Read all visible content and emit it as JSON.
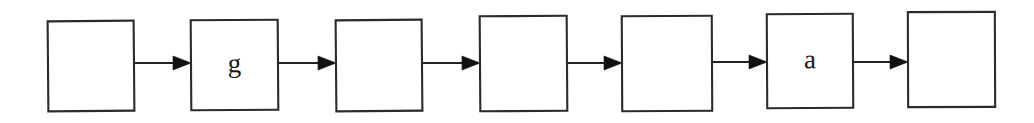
{
  "diagram": {
    "type": "flowchart",
    "orientation": "left-to-right",
    "title": "",
    "canvas": {
      "width": 1034,
      "height": 123
    },
    "background_color": "#ffffff",
    "box_stroke_color": "#2b2b2b",
    "arrow_color": "#111111",
    "text_color": "#191919",
    "node_count": 7,
    "arrow_count": 6,
    "nodes": [
      {
        "id": "node-1",
        "label": "",
        "x": 48,
        "y": 21,
        "width": 86,
        "height": 90,
        "rotation": -0.5
      },
      {
        "id": "node-2",
        "label": "g",
        "x": 191,
        "y": 20,
        "width": 87,
        "height": 90,
        "rotation": -0.4
      },
      {
        "id": "node-3",
        "label": "",
        "x": 336,
        "y": 20,
        "width": 86,
        "height": 91,
        "rotation": -0.5
      },
      {
        "id": "node-4",
        "label": "",
        "x": 480,
        "y": 16,
        "width": 87,
        "height": 95,
        "rotation": -0.4
      },
      {
        "id": "node-5",
        "label": "",
        "x": 622,
        "y": 16,
        "width": 90,
        "height": 95,
        "rotation": -0.3
      },
      {
        "id": "node-6",
        "label": "a",
        "x": 767,
        "y": 14,
        "width": 86,
        "height": 94,
        "rotation": -0.3
      },
      {
        "id": "node-7",
        "label": "",
        "x": 908,
        "y": 12,
        "width": 87,
        "height": 95,
        "rotation": -0.2
      }
    ],
    "arrows": [
      {
        "id": "arrow-1",
        "from": "node-1",
        "to": "node-2",
        "x1": 134,
        "x2": 191,
        "y": 63
      },
      {
        "id": "arrow-2",
        "from": "node-2",
        "to": "node-3",
        "x1": 278,
        "x2": 336,
        "y": 63
      },
      {
        "id": "arrow-3",
        "from": "node-3",
        "to": "node-4",
        "x1": 422,
        "x2": 480,
        "y": 63
      },
      {
        "id": "arrow-4",
        "from": "node-4",
        "to": "node-5",
        "x1": 567,
        "x2": 622,
        "y": 63
      },
      {
        "id": "arrow-5",
        "from": "node-5",
        "to": "node-6",
        "x1": 712,
        "x2": 767,
        "y": 62
      },
      {
        "id": "arrow-6",
        "from": "node-6",
        "to": "node-7",
        "x1": 853,
        "x2": 908,
        "y": 62
      }
    ],
    "arrow_head": {
      "length": 18,
      "half_height": 7
    }
  }
}
